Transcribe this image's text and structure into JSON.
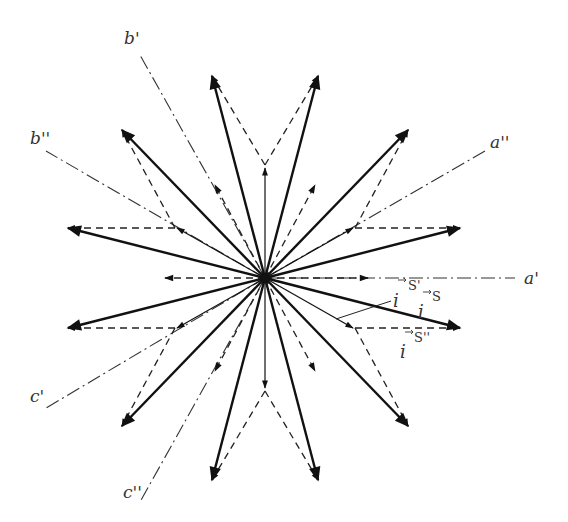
{
  "diagram": {
    "type": "phasor-star",
    "center": [
      265,
      278
    ],
    "colors": {
      "stroke": "#111111",
      "axis": "#333333",
      "background": "#ffffff"
    },
    "axes": [
      {
        "name": "a'",
        "label": "a'",
        "angle_deg": 0,
        "end": [
          515,
          278
        ],
        "label_pos": [
          524,
          284
        ]
      },
      {
        "name": "a''",
        "label": "a''",
        "angle_deg": 30,
        "end": [
          485,
          151
        ],
        "label_pos": [
          490,
          148
        ]
      },
      {
        "name": "b'",
        "label": "b'",
        "angle_deg": 120,
        "end": [
          140,
          55
        ],
        "label_pos": [
          124,
          44
        ]
      },
      {
        "name": "b''",
        "label": "b''",
        "angle_deg": 150,
        "end": [
          46,
          151
        ],
        "label_pos": [
          30,
          144
        ]
      },
      {
        "name": "c'",
        "label": "c'",
        "angle_deg": 210,
        "end": [
          46,
          408
        ],
        "label_pos": [
          30,
          402
        ]
      },
      {
        "name": "c''",
        "label": "c''",
        "angle_deg": 240,
        "end": [
          140,
          502
        ],
        "label_pos": [
          123,
          498
        ]
      }
    ],
    "vector_labels": {
      "i_s": {
        "base": "i",
        "sup": "S",
        "pos": [
          418,
          300
        ]
      },
      "i_s1": {
        "base": "i",
        "sup": "S'",
        "pos": [
          381,
          325
        ]
      },
      "i_s2": {
        "base": "i",
        "sup": "S''",
        "pos": [
          398,
          362
        ]
      }
    },
    "resultant_arrows": [
      [
        460,
        328
      ],
      [
        460,
        228
      ],
      [
        408,
        130
      ],
      [
        318,
        76
      ],
      [
        212,
        76
      ],
      [
        122,
        130
      ],
      [
        68,
        228
      ],
      [
        68,
        328
      ],
      [
        122,
        426
      ],
      [
        212,
        480
      ],
      [
        318,
        480
      ],
      [
        408,
        426
      ]
    ],
    "thin_arrows": [
      [
        353,
        228
      ],
      [
        265,
        168
      ],
      [
        177,
        228
      ],
      [
        177,
        328
      ],
      [
        265,
        388
      ],
      [
        353,
        328
      ]
    ],
    "short_dashed_arrows": [
      [
        315,
        185
      ],
      [
        215,
        185
      ],
      [
        165,
        278
      ],
      [
        215,
        371
      ],
      [
        315,
        371
      ],
      [
        368,
        278
      ]
    ]
  }
}
